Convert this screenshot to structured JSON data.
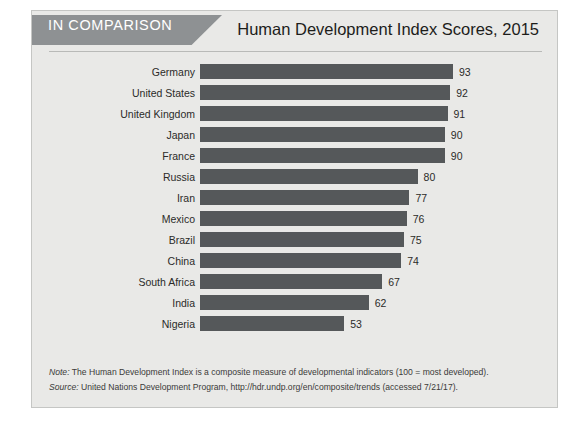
{
  "header": {
    "banner_label": "IN COMPARISON",
    "title": "Human Development Index Scores, 2015"
  },
  "notes": {
    "note_label": "Note:",
    "note_text": " The Human Development Index is a composite measure of developmental indicators (100 = most developed).",
    "source_label": "Source:",
    "source_text": " United Nations Development Program, http://hdr.undp.org/en/composite/trends (accessed 7/21/17)."
  },
  "colors": {
    "bar": "#55585a",
    "banner": "#8e9193",
    "card_background": "#e9e9e7",
    "card_border": "#c5c6c4"
  },
  "chart_data": {
    "type": "bar",
    "orientation": "horizontal",
    "title": "Human Development Index Scores, 2015",
    "xlabel": "",
    "ylabel": "",
    "xlim": [
      0,
      100
    ],
    "grid": false,
    "legend": false,
    "categories": [
      "Germany",
      "United States",
      "United Kingdom",
      "Japan",
      "France",
      "Russia",
      "Iran",
      "Mexico",
      "Brazil",
      "China",
      "South Africa",
      "India",
      "Nigeria"
    ],
    "values": [
      93,
      92,
      91,
      90,
      90,
      80,
      77,
      76,
      75,
      74,
      67,
      62,
      53
    ]
  }
}
